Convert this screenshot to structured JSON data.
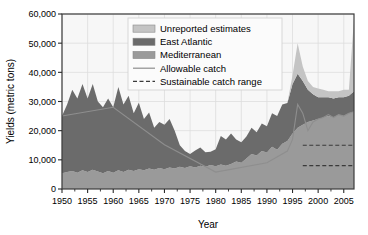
{
  "chart_data": {
    "type": "area",
    "title": "",
    "xlabel": "Year",
    "ylabel": "Yields (metric tons)",
    "xlim": [
      1950,
      2007
    ],
    "ylim": [
      0,
      60000
    ],
    "grid": true,
    "legend_position": "top-right",
    "stacked": true,
    "x_ticks": [
      "1950",
      "1955",
      "1960",
      "1965",
      "1970",
      "1975",
      "1980",
      "1985",
      "1990",
      "1995",
      "2000",
      "2005"
    ],
    "x_tick_values": [
      1950,
      1955,
      1960,
      1965,
      1970,
      1975,
      1980,
      1985,
      1990,
      1995,
      2000,
      2005
    ],
    "y_ticks": [
      "0",
      "10,000",
      "20,000",
      "30,000",
      "40,000",
      "50,000",
      "60,000"
    ],
    "y_tick_values": [
      0,
      10000,
      20000,
      30000,
      40000,
      50000,
      60000
    ],
    "x": [
      1950,
      1951,
      1952,
      1953,
      1954,
      1955,
      1956,
      1957,
      1958,
      1959,
      1960,
      1961,
      1962,
      1963,
      1964,
      1965,
      1966,
      1967,
      1968,
      1969,
      1970,
      1971,
      1972,
      1973,
      1974,
      1975,
      1976,
      1977,
      1978,
      1979,
      1980,
      1981,
      1982,
      1983,
      1984,
      1985,
      1986,
      1987,
      1988,
      1989,
      1990,
      1991,
      1992,
      1993,
      1994,
      1995,
      1996,
      1997,
      1998,
      1999,
      2000,
      2001,
      2002,
      2003,
      2004,
      2005,
      2006,
      2007
    ],
    "series": [
      {
        "name": "Mediterranean",
        "color": "#9a9a9a",
        "values": [
          5400,
          5800,
          6200,
          5600,
          6400,
          5800,
          6600,
          6000,
          5400,
          6200,
          5600,
          6400,
          5800,
          6600,
          6200,
          6800,
          6400,
          7000,
          6600,
          7200,
          6800,
          7400,
          7000,
          7600,
          7200,
          7800,
          7400,
          8000,
          7600,
          8200,
          7800,
          8400,
          8000,
          8600,
          9400,
          9000,
          10500,
          12000,
          11500,
          13000,
          12500,
          14500,
          13500,
          15500,
          16500,
          19000,
          21000,
          22000,
          23000,
          23500,
          24000,
          24500,
          25000,
          24500,
          25500,
          25000,
          26000,
          26500
        ]
      },
      {
        "name": "East Atlantic",
        "color": "#6b6b6b",
        "values": [
          19600,
          23200,
          27800,
          25400,
          29600,
          25200,
          29400,
          24000,
          22600,
          24800,
          22400,
          28600,
          23200,
          25400,
          19800,
          22800,
          17600,
          19200,
          14400,
          15800,
          15200,
          16600,
          13000,
          7400,
          5800,
          4200,
          5800,
          6200,
          5000,
          4600,
          5800,
          9800,
          9000,
          10400,
          7600,
          7000,
          7500,
          9000,
          8000,
          9500,
          9000,
          11500,
          11500,
          13500,
          13000,
          17000,
          18500,
          15000,
          11000,
          9000,
          7500,
          7000,
          6500,
          6500,
          6000,
          6500,
          6000,
          7000
        ]
      },
      {
        "name": "Unreported estimates",
        "color": "#c4c4c4",
        "values": [
          0,
          0,
          0,
          0,
          0,
          0,
          0,
          0,
          0,
          0,
          0,
          0,
          0,
          0,
          0,
          0,
          0,
          0,
          0,
          0,
          0,
          0,
          0,
          0,
          0,
          0,
          0,
          0,
          0,
          0,
          0,
          0,
          0,
          0,
          0,
          0,
          0,
          0,
          0,
          0,
          0,
          0,
          0,
          0,
          0,
          3000,
          10500,
          5000,
          3000,
          2500,
          3000,
          2500,
          2000,
          2500,
          2000,
          2500,
          2000,
          25000
        ]
      }
    ],
    "lines": [
      {
        "name": "Allowable catch",
        "style": "solid",
        "color": "#8e8e8e",
        "x": [
          1950,
          1960,
          1970,
          1980,
          1990,
          1994,
          1995,
          1996,
          1997,
          1998,
          1999,
          2000,
          2001,
          2002,
          2003,
          2004,
          2005,
          2006,
          2007
        ],
        "y": [
          25000,
          28000,
          15200,
          5800,
          9000,
          13000,
          17000,
          29000,
          26000,
          20000,
          23000,
          24000,
          24500,
          25500,
          24500,
          25500,
          25000,
          26000,
          26500
        ]
      },
      {
        "name": "Sustainable catch range",
        "style": "dashed",
        "color": "#3a3a3a",
        "upper": 15000,
        "lower": 8000,
        "x_start": 1997,
        "x_end": 2007
      }
    ],
    "legend": [
      {
        "label": "Unreported estimates",
        "type": "swatch",
        "color": "#c4c4c4"
      },
      {
        "label": "East Atlantic",
        "type": "swatch",
        "color": "#6b6b6b"
      },
      {
        "label": "Mediterranean",
        "type": "swatch",
        "color": "#9a9a9a"
      },
      {
        "label": "Allowable catch",
        "type": "line-solid",
        "color": "#8e8e8e"
      },
      {
        "label": "Sustainable catch range",
        "type": "line-dashed",
        "color": "#3a3a3a"
      }
    ]
  }
}
